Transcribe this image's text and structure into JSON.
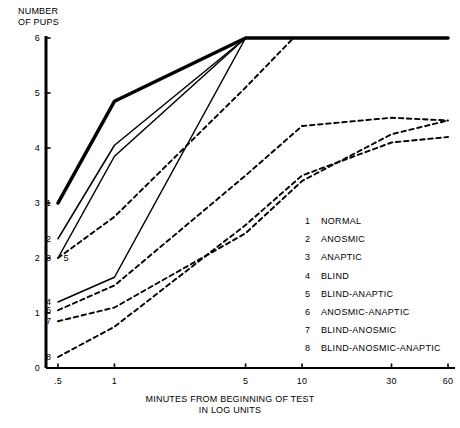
{
  "chart_data": {
    "type": "line",
    "title": "",
    "ylabel": "NUMBER\nOF PUPS",
    "xlabel": "MINUTES FROM BEGINNING OF TEST\nIN LOG UNITS",
    "xscale": "log",
    "xticks": [
      0.5,
      1,
      5,
      10,
      30,
      60
    ],
    "xtick_labels": [
      ".5",
      "1",
      "5",
      "10",
      "30",
      "60"
    ],
    "yticks": [
      0,
      1,
      2,
      3,
      4,
      5,
      6
    ],
    "ytick_labels": [
      "0",
      "1",
      "2",
      "3",
      "4",
      "5",
      "6"
    ],
    "xlim": [
      0.42,
      60
    ],
    "ylim": [
      0,
      6
    ],
    "grid": false,
    "legend_position": "inside-lower-right",
    "series": [
      {
        "key": "1",
        "name": "NORMAL",
        "style": "solid-heavy",
        "x": [
          0.5,
          1,
          5,
          60
        ],
        "y": [
          3.0,
          4.85,
          6.0,
          6.0
        ]
      },
      {
        "key": "2",
        "name": "ANOSMIC",
        "style": "solid",
        "x": [
          0.5,
          1,
          5
        ],
        "y": [
          2.35,
          4.05,
          6.0
        ]
      },
      {
        "key": "3",
        "name": "ANAPTIC",
        "style": "solid",
        "x": [
          0.5,
          1,
          5
        ],
        "y": [
          2.0,
          3.85,
          6.0
        ]
      },
      {
        "key": "4",
        "name": "BLIND",
        "style": "solid",
        "x": [
          0.5,
          1,
          5
        ],
        "y": [
          1.2,
          1.65,
          6.0
        ]
      },
      {
        "key": "5",
        "name": "BLIND-ANAPTIC",
        "style": "dashed",
        "x": [
          0.5,
          1,
          5,
          9,
          60
        ],
        "y": [
          2.0,
          2.75,
          5.1,
          6.0,
          6.0
        ]
      },
      {
        "key": "6",
        "name": "ANOSMIC-ANAPTIC",
        "style": "dashed",
        "x": [
          0.5,
          1,
          5,
          10,
          30,
          60
        ],
        "y": [
          1.05,
          1.5,
          3.5,
          4.4,
          4.55,
          4.5
        ]
      },
      {
        "key": "7",
        "name": "BLIND-ANOSMIC",
        "style": "dashed",
        "x": [
          0.5,
          1,
          5,
          10,
          30,
          60
        ],
        "y": [
          0.85,
          1.1,
          2.45,
          3.4,
          4.25,
          4.5
        ]
      },
      {
        "key": "8",
        "name": "BLIND-ANOSMIC-ANAPTIC",
        "style": "dashed",
        "x": [
          0.5,
          1,
          5,
          10,
          30,
          60
        ],
        "y": [
          0.2,
          0.75,
          2.6,
          3.5,
          4.1,
          4.2
        ]
      }
    ],
    "curve_start_labels": [
      {
        "key": "1",
        "x": 0.5,
        "y": 3.0
      },
      {
        "key": "2",
        "x": 0.5,
        "y": 2.35
      },
      {
        "key": "3",
        "x": 0.5,
        "y": 2.0
      },
      {
        "key": "5",
        "x": 0.62,
        "y": 2.0
      },
      {
        "key": "4",
        "x": 0.5,
        "y": 1.2
      },
      {
        "key": "6",
        "x": 0.5,
        "y": 1.05
      },
      {
        "key": "7",
        "x": 0.5,
        "y": 0.85
      },
      {
        "key": "8",
        "x": 0.5,
        "y": 0.2
      }
    ]
  },
  "legend": {
    "entries": [
      {
        "key": "1",
        "label": "NORMAL"
      },
      {
        "key": "2",
        "label": "ANOSMIC"
      },
      {
        "key": "3",
        "label": "ANAPTIC"
      },
      {
        "key": "4",
        "label": "BLIND"
      },
      {
        "key": "5",
        "label": "BLIND-ANAPTIC"
      },
      {
        "key": "6",
        "label": "ANOSMIC-ANAPTIC"
      },
      {
        "key": "7",
        "label": "BLIND-ANOSMIC"
      },
      {
        "key": "8",
        "label": "BLIND-ANOSMIC-ANAPTIC"
      }
    ]
  },
  "colors": {
    "ink": "#000000",
    "background": "#ffffff"
  }
}
